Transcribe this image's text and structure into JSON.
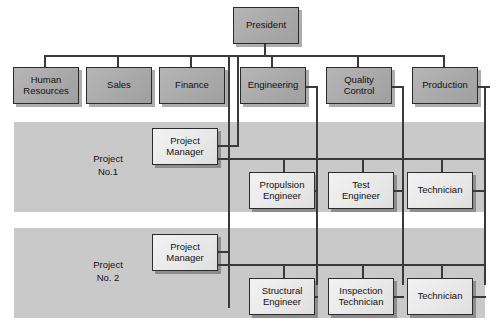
{
  "diagram": {
    "type": "org-chart",
    "colors": {
      "band_fill": "#c9c9c9",
      "executive_fill": "#a8a8a8",
      "staff_fill": "#e6e6e6",
      "line": "#3a3a3a",
      "border": "#2b2b2b",
      "background": "#ffffff"
    }
  },
  "nodes": {
    "president": "President",
    "human_resources": "Human\nResources",
    "sales": "Sales",
    "finance": "Finance",
    "engineering": "Engineering",
    "quality_control": "Quality\nControl",
    "production": "Production",
    "project_manager_1": "Project\nManager",
    "propulsion_engineer": "Propulsion\nEngineer",
    "test_engineer": "Test\nEngineer",
    "technician_1": "Technician",
    "project_manager_2": "Project\nManager",
    "structural_engineer": "Structural\nEngineer",
    "inspection_technician": "Inspection\nTechnician",
    "technician_2": "Technician"
  },
  "bands": {
    "project_1": "Project\nNo.1",
    "project_2": "Project\nNo. 2"
  }
}
